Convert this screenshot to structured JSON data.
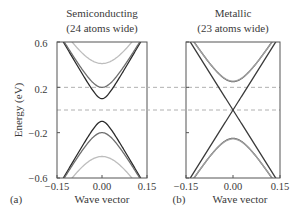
{
  "chart_data": [
    {
      "type": "line",
      "panel_label": "(a)",
      "title": "Semiconducting",
      "subtitle": "(24 atoms wide)",
      "xlabel": "Wave vector",
      "ylabel": "Energy (eV)",
      "xlim": [
        -0.15,
        0.15
      ],
      "ylim": [
        -0.6,
        0.6
      ],
      "xticks": [
        "-0.15",
        "0.00",
        "0.15"
      ],
      "yticks": [
        "0.6",
        "0.2",
        "-0.2",
        "-0.6"
      ],
      "reference_lines": [
        0.2,
        0.0
      ],
      "bands": [
        {
          "name": "conduction-1",
          "color": "#2a2a2a",
          "gap_edge": 0.1,
          "slope": 4.6,
          "sign": 1
        },
        {
          "name": "conduction-2",
          "color": "#6e6e6e",
          "gap_edge": 0.2,
          "slope": 4.5,
          "sign": 1
        },
        {
          "name": "conduction-3",
          "color": "#bdbdbd",
          "gap_edge": 0.41,
          "slope": 4.4,
          "sign": 1
        },
        {
          "name": "valence-1",
          "color": "#2a2a2a",
          "gap_edge": 0.1,
          "slope": 4.6,
          "sign": -1
        },
        {
          "name": "valence-2",
          "color": "#6e6e6e",
          "gap_edge": 0.2,
          "slope": 4.5,
          "sign": -1
        },
        {
          "name": "valence-3",
          "color": "#bdbdbd",
          "gap_edge": 0.41,
          "slope": 4.4,
          "sign": -1
        }
      ]
    },
    {
      "type": "line",
      "panel_label": "(b)",
      "title": "Metallic",
      "subtitle": "(23 atoms wide)",
      "xlabel": "Wave vector",
      "ylabel": "",
      "xlim": [
        -0.15,
        0.15
      ],
      "ylim": [
        -0.6,
        0.6
      ],
      "xticks": [
        "-0.15",
        "0.00",
        "0.15"
      ],
      "yticks": [],
      "reference_lines": [
        0.2,
        0.0
      ],
      "bands": [
        {
          "name": "linear-up",
          "color": "#3a3a3a",
          "gap_edge": 0.0,
          "slope": 4.4,
          "sign": 1
        },
        {
          "name": "linear-down",
          "color": "#3a3a3a",
          "gap_edge": 0.0,
          "slope": 4.4,
          "sign": -1
        },
        {
          "name": "conduction-a",
          "color": "#5a5a5a",
          "gap_edge": 0.25,
          "slope": 4.4,
          "sign": 1
        },
        {
          "name": "conduction-b",
          "color": "#a0a0a0",
          "gap_edge": 0.255,
          "slope": 4.35,
          "sign": 1
        },
        {
          "name": "valence-a",
          "color": "#5a5a5a",
          "gap_edge": 0.25,
          "slope": 4.4,
          "sign": -1
        },
        {
          "name": "valence-b",
          "color": "#a0a0a0",
          "gap_edge": 0.255,
          "slope": 4.35,
          "sign": -1
        }
      ]
    }
  ]
}
